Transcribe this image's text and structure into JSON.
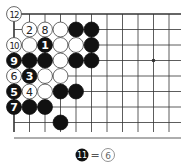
{
  "diagram": {
    "type": "go-board-corner",
    "grid": {
      "cols": 11,
      "rows": 9,
      "origin_x": 14,
      "origin_y": 14,
      "spacing": 15.5
    },
    "colors": {
      "line": "#333333",
      "black": "#111111",
      "white": "#ffffff",
      "text_on_black": "#ffffff",
      "text_on_white": "#222222"
    },
    "star_points": [
      {
        "col": 9,
        "row": 3
      }
    ],
    "stones": [
      {
        "col": 0,
        "row": 0,
        "color": "white",
        "label": "12"
      },
      {
        "col": 1,
        "row": 1,
        "color": "white",
        "label": "2"
      },
      {
        "col": 2,
        "row": 1,
        "color": "white",
        "label": "8"
      },
      {
        "col": 3,
        "row": 1,
        "color": "white",
        "label": ""
      },
      {
        "col": 4,
        "row": 1,
        "color": "black",
        "label": ""
      },
      {
        "col": 5,
        "row": 1,
        "color": "black",
        "label": ""
      },
      {
        "col": 0,
        "row": 2,
        "color": "white",
        "label": "10"
      },
      {
        "col": 1,
        "row": 2,
        "color": "white",
        "label": ""
      },
      {
        "col": 2,
        "row": 2,
        "color": "black",
        "label": "1"
      },
      {
        "col": 3,
        "row": 2,
        "color": "white",
        "label": ""
      },
      {
        "col": 4,
        "row": 2,
        "color": "white",
        "label": ""
      },
      {
        "col": 5,
        "row": 2,
        "color": "black",
        "label": ""
      },
      {
        "col": 0,
        "row": 3,
        "color": "black",
        "label": "9"
      },
      {
        "col": 1,
        "row": 3,
        "color": "black",
        "label": ""
      },
      {
        "col": 2,
        "row": 3,
        "color": "black",
        "label": ""
      },
      {
        "col": 3,
        "row": 3,
        "color": "white",
        "label": ""
      },
      {
        "col": 4,
        "row": 3,
        "color": "black",
        "label": ""
      },
      {
        "col": 5,
        "row": 3,
        "color": "black",
        "label": ""
      },
      {
        "col": 0,
        "row": 4,
        "color": "white",
        "label": "6"
      },
      {
        "col": 1,
        "row": 4,
        "color": "black",
        "label": "3"
      },
      {
        "col": 2,
        "row": 4,
        "color": "white",
        "label": ""
      },
      {
        "col": 3,
        "row": 4,
        "color": "white",
        "label": ""
      },
      {
        "col": 0,
        "row": 5,
        "color": "black",
        "label": "5"
      },
      {
        "col": 1,
        "row": 5,
        "color": "white",
        "label": "4"
      },
      {
        "col": 2,
        "row": 5,
        "color": "white",
        "label": ""
      },
      {
        "col": 3,
        "row": 5,
        "color": "black",
        "label": ""
      },
      {
        "col": 4,
        "row": 5,
        "color": "black",
        "label": ""
      },
      {
        "col": 0,
        "row": 6,
        "color": "black",
        "label": "7"
      },
      {
        "col": 1,
        "row": 6,
        "color": "black",
        "label": ""
      },
      {
        "col": 2,
        "row": 6,
        "color": "black",
        "label": ""
      },
      {
        "col": 3,
        "row": 7,
        "color": "black",
        "label": ""
      }
    ],
    "caption": {
      "left_stone": {
        "color": "black",
        "label": "11"
      },
      "equals": "=",
      "right_stone": {
        "color": "white",
        "label": "6"
      }
    }
  }
}
